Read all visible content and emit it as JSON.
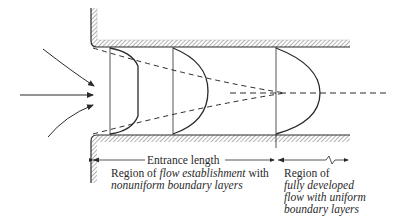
{
  "diagram": {
    "labels": {
      "entrance_length": "Entrance length",
      "region1_line1_a": "Region of ",
      "region1_line1_b": "flow establishment",
      "region1_line1_c": " with",
      "region1_line2": "nonuniform boundary layers",
      "region2_line1": "Region of",
      "region2_line2": "fully developed",
      "region2_line3_a": "flow with ",
      "region2_line3_b": "uniform",
      "region2_line4": "boundary layers"
    },
    "elements": [
      "pipe-upper-wall",
      "pipe-lower-wall",
      "inflow-arrows",
      "velocity-profile-flat",
      "velocity-profile-developing",
      "velocity-profile-fully-developed",
      "boundary-layer-dashed-lines",
      "centerline",
      "entrance-length-dimension"
    ],
    "colors": {
      "line": "#2a2a2a",
      "hatch": "#555555",
      "background": "#ffffff"
    }
  }
}
